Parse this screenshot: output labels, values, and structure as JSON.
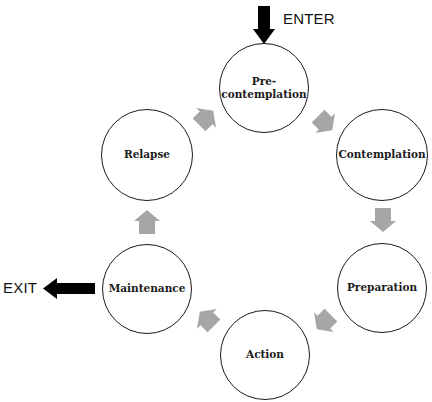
{
  "diagram": {
    "type": "cycle",
    "entry_label": "ENTER",
    "exit_label": "EXIT",
    "stages": [
      {
        "id": "precontemplation",
        "label": "Pre-\ncontemplation",
        "cx": 264,
        "cy": 88,
        "r": 45
      },
      {
        "id": "contemplation",
        "label": "Contemplation",
        "cx": 382,
        "cy": 155,
        "r": 46
      },
      {
        "id": "preparation",
        "label": "Preparation",
        "cx": 382,
        "cy": 288,
        "r": 45
      },
      {
        "id": "action",
        "label": "Action",
        "cx": 265,
        "cy": 355,
        "r": 45
      },
      {
        "id": "maintenance",
        "label": "Maintenance",
        "cx": 147,
        "cy": 289,
        "r": 45
      },
      {
        "id": "relapse",
        "label": "Relapse",
        "cx": 147,
        "cy": 155,
        "r": 46
      }
    ],
    "transitions": [
      {
        "from": "precontemplation",
        "to": "contemplation"
      },
      {
        "from": "contemplation",
        "to": "preparation"
      },
      {
        "from": "preparation",
        "to": "action"
      },
      {
        "from": "action",
        "to": "maintenance"
      },
      {
        "from": "maintenance",
        "to": "relapse"
      },
      {
        "from": "relapse",
        "to": "precontemplation"
      }
    ],
    "colors": {
      "circle_stroke": "#1a1a1a",
      "cycle_arrow": "#a6a6a6",
      "enter_exit_arrow": "#000000",
      "background": "#ffffff"
    }
  }
}
